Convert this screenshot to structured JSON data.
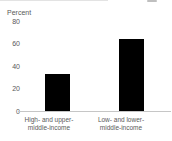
{
  "chart_data": {
    "type": "bar",
    "ylabel": "Percent",
    "categories": [
      {
        "lines": [
          "High- and upper-",
          "middle-income"
        ]
      },
      {
        "lines": [
          "Low- and lower-",
          "middle-income"
        ]
      }
    ],
    "values": [
      33,
      64
    ],
    "ylim": [
      0,
      80
    ],
    "yticks": [
      0,
      20,
      40,
      60,
      80
    ],
    "grid": false,
    "legend": null,
    "colors": {
      "bar": "#000000",
      "axis": "#c6c6c6",
      "text": "#595959"
    }
  }
}
